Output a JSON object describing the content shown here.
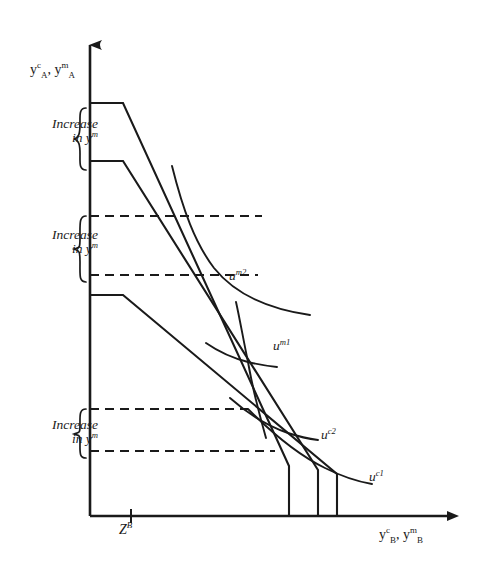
{
  "figure": {
    "type": "economics-diagram"
  },
  "axes": {
    "y_axis_label": "yAc, yAm",
    "y_axis_label_parts": {
      "base1": "y",
      "sub1": "A",
      "sup1": "c",
      "sep": ", ",
      "base2": "y",
      "sub2": "A",
      "sup2": "m"
    },
    "x_axis_label": "yBc, yBm",
    "x_axis_label_parts": {
      "base1": "y",
      "sub1": "B",
      "sup1": "c",
      "sep": ", ",
      "base2": "y",
      "sub2": "B",
      "sup2": "m"
    },
    "x_tick_label": "Z",
    "x_tick_sup": "B",
    "x_tick_value": 131,
    "origin": {
      "x": 90,
      "y": 516
    },
    "x_arrow_end": 460,
    "y_arrow_end": 33
  },
  "brace_labels": [
    {
      "line1": "Increase",
      "line2_pre": "in y",
      "line2_sup": "m",
      "top": 108,
      "bottom": 170
    },
    {
      "line1": "Increase",
      "line2_pre": "in y",
      "line2_sup": "m",
      "top": 216,
      "bottom": 282
    },
    {
      "line1": "Increase",
      "line2_pre": "in y",
      "line2_sup": "m",
      "top": 409,
      "bottom": 458
    }
  ],
  "curve_labels": [
    {
      "name": "u",
      "sup": "m2"
    },
    {
      "name": "u",
      "sup": "m1"
    },
    {
      "name": "u",
      "sup": "c2"
    },
    {
      "name": "u",
      "sup": "c1"
    }
  ],
  "chart_data": {
    "type": "line",
    "title": "",
    "xlabel": "yBc, yBm",
    "ylabel": "yAc, yAm",
    "grid": false,
    "legend": "inline-curve-labels",
    "dashed_gridlines_y": [
      216,
      275,
      409,
      451
    ],
    "budget_lines": [
      {
        "id": "budget-1",
        "flat_y": 103,
        "kink_x": 123,
        "drop_x": 289
      },
      {
        "id": "budget-2",
        "flat_y": 161,
        "kink_x": 123,
        "drop_x": 318
      },
      {
        "id": "budget-3",
        "flat_y": 295,
        "kink_x": 123,
        "drop_x": 337
      }
    ],
    "indifference_curves": [
      {
        "id": "u-m2",
        "label": "u m2"
      },
      {
        "id": "u-m1",
        "label": "u m1"
      },
      {
        "id": "u-c2",
        "label": "u c2"
      },
      {
        "id": "u-c1",
        "label": "u c1"
      }
    ]
  },
  "colors": {
    "ink": "#1a1a1a",
    "background": "#ffffff"
  }
}
